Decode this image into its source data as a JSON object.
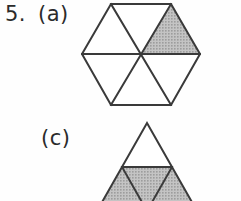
{
  "worksheet": {
    "question_number": "5.",
    "part_a_label": "(a)",
    "part_c_label": "(c)",
    "ink_color": "#3a3a3a",
    "shade_color": "#b5b5b5",
    "background_color": "#fefefe"
  },
  "figures": [
    {
      "id": "figure-a",
      "part": "(a)",
      "shape": "hexagon",
      "total_parts": 6,
      "shaded_parts": 1,
      "fraction": "1/6",
      "center_x": 141,
      "center_y": 54,
      "radius": 59,
      "segments": [
        {
          "name": "upper-left",
          "shaded": false
        },
        {
          "name": "top",
          "shaded": false
        },
        {
          "name": "upper-right",
          "shaded": true
        },
        {
          "name": "lower-right",
          "shaded": false
        },
        {
          "name": "bottom",
          "shaded": false
        },
        {
          "name": "lower-left",
          "shaded": false
        }
      ]
    },
    {
      "id": "figure-c",
      "part": "(c)",
      "shape": "triangle",
      "total_parts": 4,
      "shaded_parts": 3,
      "fraction": "3/4",
      "apex_x": 147,
      "apex_y": 123,
      "half_width": 50,
      "clipped_at_bottom": true,
      "segments": [
        {
          "name": "top",
          "shaded": false
        },
        {
          "name": "bottom-left",
          "shaded": true
        },
        {
          "name": "bottom-middle-inverted",
          "shaded": true
        },
        {
          "name": "bottom-right",
          "shaded": true
        }
      ]
    }
  ]
}
